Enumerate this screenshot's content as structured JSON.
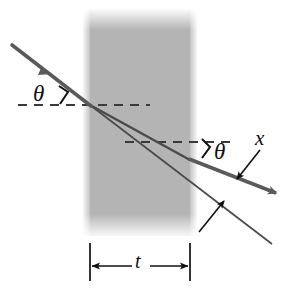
{
  "figure": {
    "background_color": "#ffffff"
  },
  "slab": {
    "name": "transparent-slab",
    "fill_color": "#b4b4b4",
    "left_px": 90,
    "right_px": 190,
    "top_px": 12,
    "bottom_px": 232,
    "thickness_label": "t"
  },
  "labels": {
    "theta_incident": "θ",
    "theta_exit": "θ",
    "displacement": "x",
    "thickness": "t"
  },
  "rays": {
    "incident": {
      "name": "incident-ray",
      "color": "#5a5a5a",
      "stroke_width": 3.4,
      "from": [
        12,
        45
      ],
      "to": [
        90,
        105
      ],
      "arrowhead_at": [
        46,
        70
      ]
    },
    "refracted_inside": {
      "name": "refracted-ray-inside-slab",
      "color": "#4a4a4a",
      "stroke_width": 2.2,
      "from": [
        90,
        105
      ],
      "to": [
        190,
        160
      ]
    },
    "exit": {
      "name": "exit-ray",
      "color": "#5a5a5a",
      "stroke_width": 3.4,
      "from": [
        190,
        160
      ],
      "to": [
        282,
        196
      ],
      "arrowhead_at": [
        282,
        196
      ]
    },
    "undeviated_extension": {
      "name": "undeviated-ray-extension",
      "color": "#4a4a4a",
      "stroke_width": 1.7,
      "from": [
        90,
        105
      ],
      "to": [
        270,
        242
      ]
    }
  },
  "dashed_lines": {
    "entry_normal_reference": {
      "name": "entry-horizontal-dashed-line",
      "from": [
        18,
        105
      ],
      "to": [
        150,
        105
      ],
      "color": "#3a3a3a"
    },
    "exit_normal_reference": {
      "name": "exit-horizontal-dashed-line",
      "from": [
        125,
        142
      ],
      "to": [
        236,
        142
      ],
      "color": "#3a3a3a"
    }
  },
  "angle_marks": {
    "incident_bracket": {
      "name": "incident-angle-bracket",
      "color": "#111111"
    },
    "exit_bracket": {
      "name": "exit-angle-bracket",
      "color": "#111111"
    }
  },
  "pointers": {
    "x_pointer": {
      "name": "x-displacement-pointer",
      "from": [
        258,
        152
      ],
      "to": [
        236,
        180
      ],
      "color": "#111111"
    },
    "lower_pointer": {
      "name": "lower-ray-pointer",
      "from": [
        200,
        232
      ],
      "to": [
        224,
        200
      ],
      "color": "#111111"
    }
  },
  "dimension": {
    "name": "thickness-dimension",
    "left_tick_x": 90,
    "right_tick_x": 190,
    "tick_top": 243,
    "tick_bottom": 281,
    "arrow_y": 266,
    "color": "#111111",
    "label": "t"
  }
}
